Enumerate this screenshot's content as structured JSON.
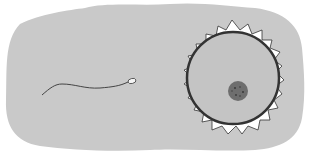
{
  "illustration": {
    "subject": "sperm approaching egg cell",
    "colors": {
      "background": "#ffffff",
      "blob": "#c9c9c9",
      "corona": "#ffffff",
      "outline": "#333333",
      "cytoplasm": "#c4c4c4",
      "nucleus": "#6e6e6e",
      "sperm_head": "#f4f4f4"
    }
  }
}
